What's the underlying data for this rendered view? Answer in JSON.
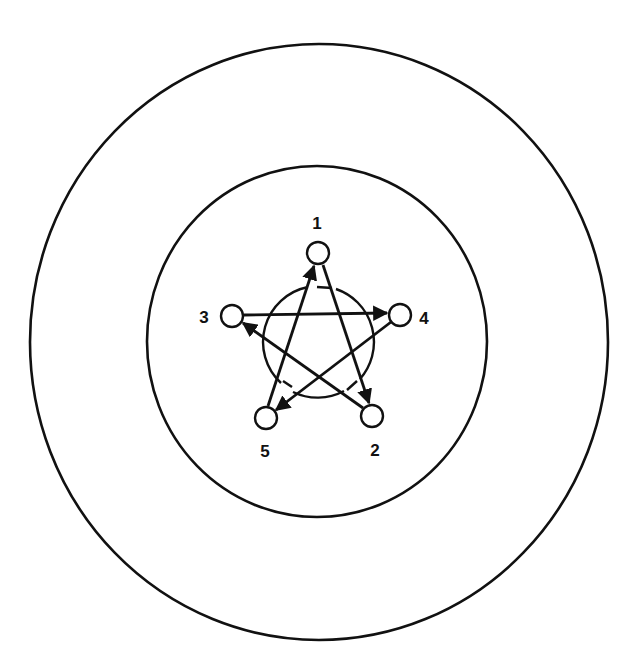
{
  "diagram": {
    "type": "directed-graph-pentagram",
    "rings": [
      {
        "name": "outer-ring",
        "cx": 319,
        "cy": 342,
        "rx": 289,
        "ry": 298
      },
      {
        "name": "middle-ring",
        "cx": 317,
        "cy": 341.5,
        "rx": 170,
        "ry": 175.5
      },
      {
        "name": "inner-ring",
        "cx": 318,
        "cy": 342,
        "r": 56
      }
    ],
    "nodes": [
      {
        "id": "1",
        "label": "1",
        "x": 318,
        "y": 253,
        "label_x": 317,
        "label_y": 229
      },
      {
        "id": "2",
        "label": "2",
        "x": 372,
        "y": 416,
        "label_x": 375,
        "label_y": 456
      },
      {
        "id": "3",
        "label": "3",
        "x": 232,
        "y": 316,
        "label_x": 204,
        "label_y": 323
      },
      {
        "id": "4",
        "label": "4",
        "x": 400,
        "y": 315,
        "label_x": 424,
        "label_y": 324
      },
      {
        "id": "5",
        "label": "5",
        "x": 266,
        "y": 418,
        "label_x": 265,
        "label_y": 457
      }
    ],
    "edges": [
      {
        "from": "5",
        "to": "1"
      },
      {
        "from": "1",
        "to": "2"
      },
      {
        "from": "3",
        "to": "4"
      },
      {
        "from": "4",
        "to": "5"
      },
      {
        "from": "2",
        "to": "3"
      }
    ],
    "node_radius": 11,
    "stroke_color": "#111111",
    "background_color": "#ffffff"
  }
}
